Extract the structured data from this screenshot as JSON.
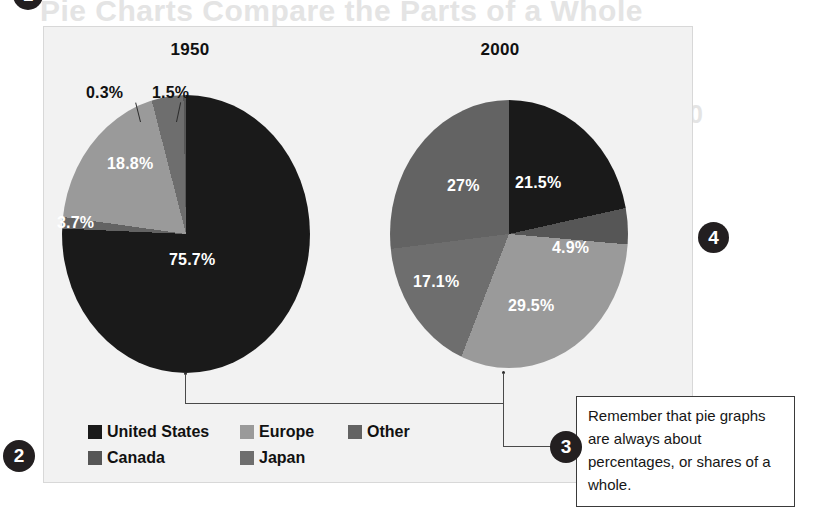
{
  "page": {
    "ghost_text": {
      "top_line": "Pie Charts Compare the Parts of a Whole",
      "line1": "Share of Nominal Dollar Inflation with",
      "line2": "Reserve Currency Shares, 1950 and 2000"
    }
  },
  "colors": {
    "united_states": "#1a1a1a",
    "canada": "#565656",
    "europe": "#9a9a9a",
    "japan": "#6e6e6e",
    "other": "#636363",
    "frame_bg": "#f2f2f2",
    "marker": "#231f20"
  },
  "charts": {
    "left": {
      "title": "1950"
    },
    "right": {
      "title": "2000"
    }
  },
  "legend": {
    "rows": [
      [
        {
          "label": "United States",
          "color_key": "united_states"
        },
        {
          "label": "Europe",
          "color_key": "europe"
        },
        {
          "label": "Other",
          "color_key": "other"
        }
      ],
      [
        {
          "label": "Canada",
          "color_key": "canada"
        },
        {
          "label": "Japan",
          "color_key": "japan"
        }
      ]
    ]
  },
  "tip": {
    "text": "Remember that pie graphs are always about percentages, or shares of a whole."
  },
  "markers": {
    "one": "1",
    "two": "2",
    "three": "3",
    "four": "4"
  },
  "chart_data": [
    {
      "type": "pie",
      "title": "1950",
      "categories": [
        "United States",
        "Other",
        "Europe",
        "Japan",
        "Canada"
      ],
      "values": [
        75.7,
        1.5,
        18.8,
        3.7,
        0.3
      ],
      "labels": [
        "75.7%",
        "1.5%",
        "18.8%",
        "3.7%",
        "0.3%"
      ],
      "colors": [
        "#1a1a1a",
        "#636363",
        "#9a9a9a",
        "#6e6e6e",
        "#565656"
      ],
      "legend_position": "bottom-left",
      "units": "percent"
    },
    {
      "type": "pie",
      "title": "2000",
      "categories": [
        "United States",
        "Canada",
        "Europe",
        "Japan",
        "Other"
      ],
      "values": [
        21.5,
        4.9,
        29.5,
        17.1,
        27.0
      ],
      "labels": [
        "21.5%",
        "4.9%",
        "29.5%",
        "17.1%",
        "27%"
      ],
      "colors": [
        "#1a1a1a",
        "#565656",
        "#9a9a9a",
        "#6e6e6e",
        "#636363"
      ],
      "legend_position": "bottom-left",
      "units": "percent"
    }
  ]
}
